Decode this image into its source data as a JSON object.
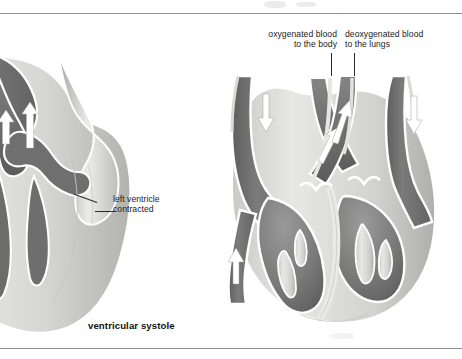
{
  "figure": {
    "caption": "ventricular systole",
    "domain_note": "anatomical cross-section diagram of the heart"
  },
  "labels": {
    "oxygenated": "oxygenated blood\nto the body",
    "deoxygenated": "deoxygenated blood\nto the lungs",
    "left_ventricle": "left ventricle\ncontracted"
  },
  "colors": {
    "blood_dark": "#707070",
    "blood_mid": "#8a8a8a",
    "muscle_light": "#dcdcd8",
    "muscle_mid": "#c4c4c0",
    "muscle_shadow": "#a9a9a5",
    "outline": "#ffffff",
    "text": "#1b1b1b",
    "rule": "#8e8e8e"
  },
  "arrows": {
    "left_diagram": [
      "up",
      "up"
    ],
    "right_diagram": [
      "down",
      "up",
      "up",
      "down",
      "up"
    ]
  }
}
